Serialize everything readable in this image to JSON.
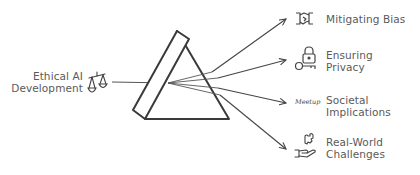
{
  "diagram": {
    "type": "prism-refraction",
    "input": {
      "line1": "Ethical AI",
      "line2": "Development",
      "icon": "scales-icon"
    },
    "outputs": [
      {
        "line1": "Mitigating Bias",
        "line2": "",
        "icon": "handshake-icon"
      },
      {
        "line1": "Ensuring",
        "line2": "Privacy",
        "icon": "lock-key-icon"
      },
      {
        "line1": "Societal",
        "line2": "Implications",
        "icon": "meetup-icon",
        "icon_text": "Meetup"
      },
      {
        "line1": "Real-World",
        "line2": "Challenges",
        "icon": "hand-puzzle-icon"
      }
    ],
    "colors": {
      "stroke": "#444444",
      "text": "#5a5a5a",
      "background": "#ffffff"
    }
  }
}
